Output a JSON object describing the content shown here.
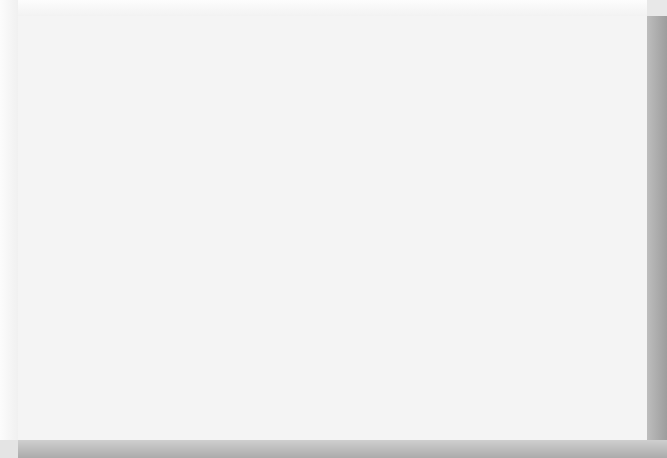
{
  "chart_title": "Country Club Organizational Chart",
  "levels": {
    "top": [
      {
        "id": "club-members",
        "label": "Club Members",
        "shade": "dark"
      },
      {
        "id": "board-of-directors",
        "label": "Board of Directors",
        "shade": "dark"
      },
      {
        "id": "general-manager",
        "label": "General Manager or\nChief Operating Officer (COO)",
        "shade": "light"
      },
      {
        "id": "executive-secretary",
        "label": "Executive Secretary",
        "shade": "mid"
      }
    ],
    "departments": [
      {
        "id": "food-and-beverage-director",
        "label": "Food and\nBeverage\nDirector",
        "shade": "dark"
      },
      {
        "id": "director-of-human-resources",
        "label": "Director\nof\nHuman\nResources",
        "shade": "light"
      },
      {
        "id": "controller",
        "label": "Controller",
        "shade": "dark"
      },
      {
        "id": "membership-director",
        "label": "Membership\nDirector",
        "shade": "mid"
      },
      {
        "id": "director-of-purchasing",
        "label": "Director of\nPurchasing",
        "shade": "light"
      },
      {
        "id": "assistant-general-manager",
        "label": "Assistant\nGeneral\nManager\n(Clubhouse\nManager)",
        "shade": "dark"
      },
      {
        "id": "golf-professional",
        "label": "Golf\nProfessional\n(Director of\nGolf)",
        "shade": "light"
      },
      {
        "id": "golf-course-superintendent",
        "label": "Golf Course\nSuperintendent",
        "shade": "dark"
      },
      {
        "id": "tennis-professional",
        "label": "Tennis\nProfessional",
        "shade": "mid"
      },
      {
        "id": "athletic-director",
        "label": "Athletic\nDirector",
        "shade": "light"
      }
    ],
    "staff": [
      {
        "parent": "food-and-beverage-director",
        "items": [
          {
            "id": "executive-chef",
            "label": "Executive\nChef",
            "shade": "dark"
          },
          {
            "id": "catering-manager",
            "label": "Catering\nManager",
            "shade": "dark"
          },
          {
            "id": "beverage-manager",
            "label": "Beverage\nManager",
            "shade": "dark"
          },
          {
            "id": "banquet-manager",
            "label": "Banquet\nManager",
            "shade": "dark"
          },
          {
            "id": "dining-room-manager",
            "label": "Dining Room\nManager",
            "shade": "dark"
          },
          {
            "id": "outlet-manager",
            "label": "Outlet\nManager",
            "shade": "dark"
          }
        ]
      },
      {
        "parent": "controller",
        "items": [
          {
            "id": "bookkeeper",
            "label": "Bookkeeper",
            "shade": "dark"
          },
          {
            "id": "accounts-receivable-clerk",
            "label": "Accounts\nReceivable\nClerk",
            "shade": "dark"
          },
          {
            "id": "accounts-payable-clerk",
            "label": "Accounts\nPayable\nClerk",
            "shade": "dark"
          },
          {
            "id": "cashier",
            "label": "Cashier",
            "shade": "dark"
          },
          {
            "id": "payroll-clerk",
            "label": "Payroll\nClerk",
            "shade": "dark"
          },
          {
            "id": "storeroom-personnel",
            "label": "Storeroom\nPersonnel",
            "shade": "dark"
          }
        ]
      },
      {
        "parent": "membership-director",
        "items": [
          {
            "id": "communications-manager",
            "label": "Communications\nManager",
            "shade": "dark"
          },
          {
            "id": "social-activities-manager",
            "label": "Social Activities\nManager",
            "shade": "dark"
          }
        ]
      },
      {
        "parent": "assistant-general-manager",
        "items": [
          {
            "id": "executive-housekeeper",
            "label": "Executive\nHousekeeper",
            "shade": "dark"
          },
          {
            "id": "chief-engineer",
            "label": "Chief\nEngineer",
            "shade": "dark"
          },
          {
            "id": "security-director",
            "label": "Security\nDirector",
            "shade": "dark"
          }
        ]
      },
      {
        "parent": "golf-professional",
        "items": [
          {
            "id": "assistant-golf-professional",
            "label": "Assistant\nGolf\nProfessional",
            "shade": "light"
          }
        ]
      },
      {
        "parent": "golf-course-superintendent",
        "items": [
          {
            "id": "maintenance-foreman",
            "label": "Maintenance\nForeman",
            "shade": "dark"
          },
          {
            "id": "pesticides-application-specialist",
            "label": "Pesticides\nApplication\nSpecialist",
            "shade": "dark"
          },
          {
            "id": "irrigation-specialist",
            "label": "Irrigation\nSpecialist",
            "shade": "dark"
          },
          {
            "id": "equipment-operator",
            "label": "Equipment\nOperator",
            "shade": "dark"
          },
          {
            "id": "equipment-mechanic",
            "label": "Equipment\nMechanic",
            "shade": "dark"
          }
        ]
      },
      {
        "parent": "tennis-professional",
        "items": [
          {
            "id": "assistant-tennis-professional",
            "label": "Assistant\nTennis\nProfessional",
            "shade": "mid"
          },
          {
            "id": "tennis-maintenance-person",
            "label": "Tennis\nMaintenance\nPerson",
            "shade": "mid"
          }
        ]
      },
      {
        "parent": "athletic-director",
        "items": [
          {
            "id": "swimming-pool-manager",
            "label": "Swimming\nPool Manager",
            "shade": "pale"
          },
          {
            "id": "health-and-fitness-director",
            "label": "Health and\nFitness Director",
            "shade": "pale"
          },
          {
            "id": "locker-room-manager",
            "label": "Locker Room\nManager",
            "shade": "pale"
          }
        ]
      }
    ]
  }
}
